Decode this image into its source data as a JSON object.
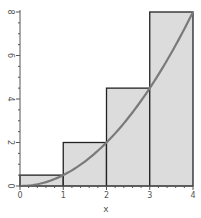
{
  "chart_data": {
    "type": "bar",
    "title": "",
    "xlabel": "x",
    "ylabel": "",
    "xlim": [
      0,
      4
    ],
    "ylim": [
      0,
      8
    ],
    "grid": false,
    "legend": null,
    "x_ticks": [
      "0",
      "1",
      "2",
      "3",
      "4"
    ],
    "y_ticks": [
      "0",
      "2",
      "4",
      "6",
      "8"
    ],
    "bars": [
      {
        "x0": 0,
        "x1": 1,
        "height": 0.5
      },
      {
        "x0": 1,
        "x1": 2,
        "height": 2
      },
      {
        "x0": 2,
        "x1": 3,
        "height": 4.5
      },
      {
        "x0": 3,
        "x1": 4,
        "height": 8
      }
    ],
    "curve": {
      "description": "f(x) = x^2/2",
      "x": [
        0,
        0.5,
        1,
        1.5,
        2,
        2.5,
        3,
        3.5,
        4
      ],
      "y": [
        0,
        0.125,
        0.5,
        1.125,
        2,
        3.125,
        4.5,
        6.125,
        8
      ]
    },
    "annotation": "Right-endpoint Riemann sum rectangles under curve",
    "colors": {
      "bar_fill": "#dcdcdc",
      "bar_stroke": "#222222",
      "curve": "#7a7a7a",
      "axis": "#555555"
    }
  }
}
